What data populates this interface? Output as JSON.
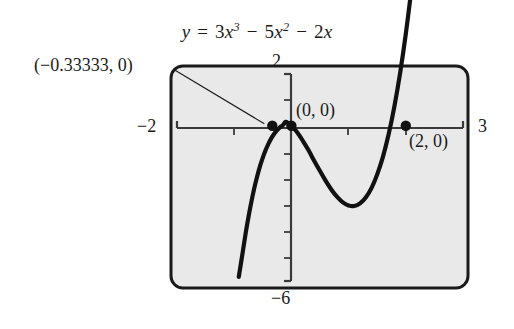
{
  "figure": {
    "title_plain": "y = 3x^3 - 5x^2 - 2x",
    "equation": {
      "lhs": "y",
      "equals": "=",
      "term1_coeff": "3",
      "term1_var": "x",
      "term1_exp": "3",
      "minus1": "−",
      "term2_coeff": "5",
      "term2_var": "x",
      "term2_exp": "2",
      "minus2": "−",
      "term3_coeff": "2",
      "term3_var": "x"
    },
    "background_color": "#e9e9e9",
    "curve_color": "#111111",
    "frame_color": "#1a1a1a",
    "axis_color": "#3a3a3a"
  },
  "axis_labels": {
    "xmin": "−2",
    "xmax": "3",
    "ymax": "2",
    "ymin": "−6"
  },
  "annotations": [
    {
      "name": "root-left",
      "text": "(−0.33333, 0)",
      "x": -0.33333,
      "y": 0,
      "has_leader_line": true
    },
    {
      "name": "origin",
      "text": "(0, 0)",
      "x": 0,
      "y": 0,
      "has_leader_line": false
    },
    {
      "name": "root-two",
      "text": "(2, 0)",
      "x": 2,
      "y": 0,
      "has_leader_line": false
    }
  ],
  "chart_data": {
    "type": "line",
    "xlabel": "",
    "ylabel": "",
    "xlim": [
      -2,
      3
    ],
    "ylim": [
      -6,
      2
    ],
    "grid": false,
    "legend": "none",
    "x_tick_labels": [
      "−2",
      "3"
    ],
    "y_tick_labels": [
      "2",
      "−6"
    ],
    "x_tick_values": [
      -2,
      -1,
      0,
      1,
      2,
      3
    ],
    "y_tick_values": [
      2,
      1,
      0,
      -1,
      -2,
      -3,
      -4,
      -5,
      -6
    ],
    "expression": "3*x^3 - 5*x^2 - 2*x",
    "roots": [
      -0.33333,
      0,
      2
    ],
    "marked_points": [
      {
        "label": "(−0.33333, 0)",
        "x": -0.33333,
        "y": 0
      },
      {
        "label": "(0, 0)",
        "x": 0,
        "y": 0
      },
      {
        "label": "(2, 0)",
        "x": 2,
        "y": 0
      }
    ],
    "series": [
      {
        "name": "y = 3x^3 - 5x^2 - 2x",
        "x": [
          -0.92,
          -0.85,
          -0.8,
          -0.75,
          -0.7,
          -0.65,
          -0.6,
          -0.55,
          -0.5,
          -0.45,
          -0.4,
          -0.35,
          -0.3,
          -0.25,
          -0.2,
          -0.15,
          -0.1,
          -0.05,
          0.0,
          0.1,
          0.2,
          0.3,
          0.4,
          0.5,
          0.6,
          0.7,
          0.8,
          0.9,
          1.0,
          1.1,
          1.2,
          1.3,
          1.4,
          1.5,
          1.6,
          1.7,
          1.8,
          1.9,
          2.0,
          2.1,
          2.2,
          2.25
        ],
        "y": [
          -5.84,
          -4.87,
          -4.16,
          -3.52,
          -2.94,
          -2.42,
          -1.97,
          -1.57,
          -1.23,
          -0.94,
          -0.69,
          -0.48,
          -0.31,
          -0.17,
          -0.06,
          0.02,
          0.15,
          0.09,
          0.0,
          -0.25,
          -0.58,
          -0.95,
          -1.36,
          -1.75,
          -2.13,
          -2.47,
          -2.75,
          -2.96,
          -3.08,
          -3.1,
          -3.0,
          -2.77,
          -2.41,
          -1.88,
          -1.2,
          -0.33,
          0.74,
          2.03,
          3.55,
          5.33,
          7.39,
          8.51
        ]
      }
    ]
  }
}
